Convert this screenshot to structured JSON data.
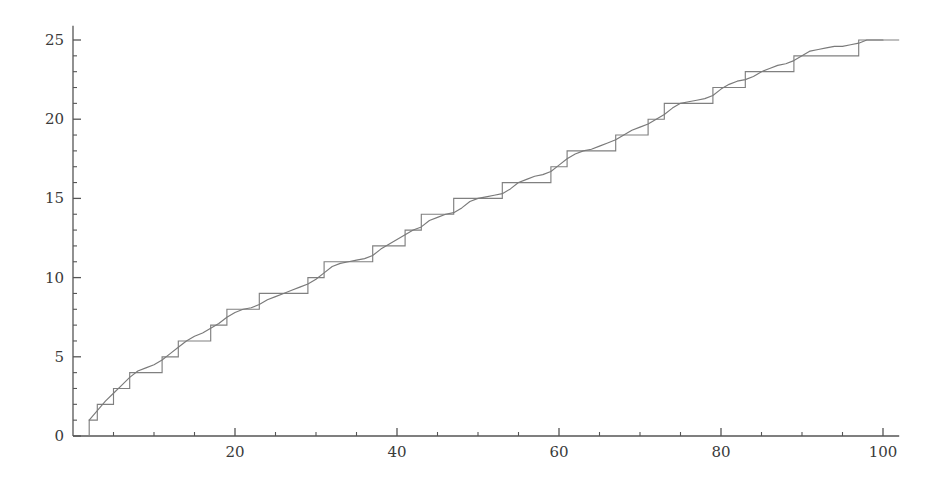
{
  "chart_data": {
    "type": "line",
    "title": "",
    "subtitle": "",
    "xlabel": "",
    "ylabel": "",
    "xlim": [
      0,
      102
    ],
    "ylim": [
      0,
      25.9
    ],
    "grid": false,
    "legend": null,
    "xticks_major": [
      20,
      40,
      60,
      80,
      100
    ],
    "xtick_labels_major": [
      "20",
      "40",
      "60",
      "80",
      "100"
    ],
    "xticks_minor": [
      5,
      10,
      15,
      25,
      30,
      35,
      45,
      50,
      55,
      65,
      70,
      75,
      85,
      90,
      95
    ],
    "yticks_major": [
      0,
      5,
      10,
      15,
      20,
      25
    ],
    "ytick_labels_major": [
      "0",
      "5",
      "10",
      "15",
      "20",
      "25"
    ],
    "yticks_minor": [
      1,
      2,
      3,
      4,
      6,
      7,
      8,
      9,
      11,
      12,
      13,
      14,
      16,
      17,
      18,
      19,
      21,
      22,
      23,
      24
    ],
    "colors": {
      "step_curve": "#808080",
      "smooth_curve": "#7a7a7a",
      "axis": "#555555",
      "text": "#3a3a3a"
    },
    "series": [
      {
        "name": "step-prime-counting",
        "type": "step",
        "description": "prime counting step function pi(x)",
        "jump_points": [
          2,
          3,
          5,
          7,
          11,
          13,
          17,
          19,
          23,
          29,
          31,
          37,
          41,
          43,
          47,
          53,
          59,
          61,
          67,
          71,
          73,
          79,
          83,
          89,
          97
        ],
        "step_values": [
          1,
          2,
          3,
          4,
          5,
          6,
          7,
          8,
          9,
          10,
          11,
          12,
          13,
          14,
          15,
          16,
          17,
          18,
          19,
          20,
          21,
          22,
          23,
          24,
          25
        ],
        "x_start": 1.8,
        "y_start": 0,
        "x_end": 102,
        "y_end": 25
      },
      {
        "name": "smooth-approximation",
        "type": "line",
        "description": "smooth approximation curve tracking the step function",
        "x": [
          2,
          3,
          4,
          5,
          6,
          7,
          8,
          9,
          10,
          11,
          12,
          13,
          14,
          15,
          16,
          17,
          18,
          19,
          20,
          21,
          22,
          23,
          24,
          25,
          26,
          27,
          28,
          29,
          30,
          31,
          32,
          33,
          34,
          35,
          36,
          37,
          38,
          39,
          40,
          41,
          42,
          43,
          44,
          45,
          46,
          47,
          48,
          49,
          50,
          51,
          52,
          53,
          54,
          55,
          56,
          57,
          58,
          59,
          60,
          61,
          62,
          63,
          64,
          65,
          66,
          67,
          68,
          69,
          70,
          71,
          72,
          73,
          74,
          75,
          76,
          77,
          78,
          79,
          80,
          81,
          82,
          83,
          84,
          85,
          86,
          87,
          88,
          89,
          90,
          91,
          92,
          93,
          94,
          95,
          96,
          97,
          98,
          99,
          100
        ],
        "y": [
          1.0,
          1.6,
          2.2,
          2.7,
          3.2,
          3.7,
          4.1,
          4.3,
          4.5,
          4.8,
          5.2,
          5.6,
          6.0,
          6.3,
          6.5,
          6.8,
          7.1,
          7.5,
          7.8,
          8.0,
          8.1,
          8.3,
          8.6,
          8.8,
          9.0,
          9.2,
          9.4,
          9.6,
          9.9,
          10.3,
          10.7,
          10.9,
          11.0,
          11.1,
          11.2,
          11.4,
          11.8,
          12.1,
          12.4,
          12.7,
          13.0,
          13.2,
          13.6,
          13.8,
          14.0,
          14.1,
          14.4,
          14.8,
          15.0,
          15.1,
          15.2,
          15.3,
          15.6,
          16.0,
          16.2,
          16.4,
          16.5,
          16.7,
          17.1,
          17.5,
          17.8,
          18.0,
          18.1,
          18.3,
          18.5,
          18.7,
          19.0,
          19.3,
          19.5,
          19.7,
          20.0,
          20.3,
          20.7,
          21.0,
          21.1,
          21.2,
          21.3,
          21.5,
          21.9,
          22.2,
          22.4,
          22.5,
          22.7,
          23.0,
          23.2,
          23.4,
          23.5,
          23.7,
          24.0,
          24.3,
          24.4,
          24.5,
          24.6,
          24.6,
          24.7,
          24.8,
          25.0,
          25.0,
          25.0
        ]
      }
    ]
  }
}
